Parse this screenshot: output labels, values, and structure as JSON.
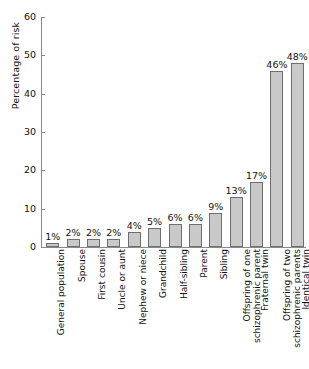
{
  "chart_data": {
    "type": "bar",
    "title": "",
    "subtitle": "",
    "xlabel": "",
    "ylabel": "Percentage of risk",
    "ylim": [
      0,
      60
    ],
    "yticks": [
      0,
      10,
      20,
      30,
      40,
      50,
      60
    ],
    "ytick_labels": [
      "0",
      "10",
      "20",
      "30",
      "40",
      "50",
      "60"
    ],
    "grid": false,
    "legend": null,
    "bar_color": "#c9c9c9",
    "bar_border_color": "#6e6e6e",
    "axis_color": "#8a8a8a",
    "value_label_suffix": "%",
    "categories": [
      "General population",
      "Spouse",
      "First cousin",
      "Uncle or aunt",
      "Nephew or niece",
      "Grandchild",
      "Half-sibling",
      "Parent",
      "Sibling",
      "Offspring of one schizophrenic parent",
      "Fraternal twin",
      "Offspring of two schizophrenic parents",
      "Identical twin"
    ],
    "category_lines": [
      [
        "General population"
      ],
      [
        "Spouse"
      ],
      [
        "First cousin"
      ],
      [
        "Uncle or aunt"
      ],
      [
        "Nephew or niece"
      ],
      [
        "Grandchild"
      ],
      [
        "Half-sibling"
      ],
      [
        "Parent"
      ],
      [
        "Sibling"
      ],
      [
        "Offspring of one",
        "schizophrenic parent"
      ],
      [
        "Fraternal twin"
      ],
      [
        "Offspring of two",
        "schizophrenic parents"
      ],
      [
        "Identical twin"
      ]
    ],
    "values": [
      1,
      2,
      2,
      2,
      4,
      5,
      6,
      6,
      9,
      13,
      17,
      46,
      48
    ],
    "value_labels": [
      "1%",
      "2%",
      "2%",
      "2%",
      "4%",
      "5%",
      "6%",
      "6%",
      "9%",
      "13%",
      "17%",
      "46%",
      "48%"
    ]
  }
}
